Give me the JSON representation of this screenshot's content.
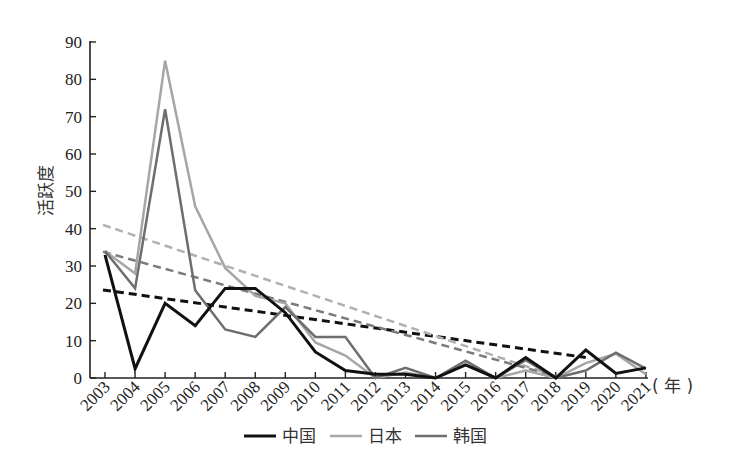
{
  "chart_data": {
    "type": "line",
    "title": "",
    "xlabel": "（年）",
    "ylabel": "活跃度",
    "ylim": [
      0,
      90
    ],
    "yticks": [
      0,
      10,
      20,
      30,
      40,
      50,
      60,
      70,
      80,
      90
    ],
    "grid": false,
    "legend_position": "bottom",
    "categories": [
      "2003",
      "2004",
      "2005",
      "2006",
      "2007",
      "2008",
      "2009",
      "2010",
      "2011",
      "2012",
      "2013",
      "2014",
      "2015",
      "2016",
      "2017",
      "2018",
      "2019",
      "2020",
      "2021"
    ],
    "series": [
      {
        "name": "中国",
        "color": "#111111",
        "width": 3,
        "values": [
          33,
          2.5,
          20,
          14,
          24,
          24,
          17.5,
          7,
          2,
          1,
          1,
          0,
          3.5,
          0,
          5.5,
          0,
          7.5,
          1.2,
          2.7
        ]
      },
      {
        "name": "日本",
        "color": "#a6a6a6",
        "width": 2.5,
        "values": [
          34,
          28,
          85,
          46,
          29.5,
          22,
          20,
          9.5,
          6,
          0,
          1.5,
          0,
          3.5,
          0,
          2,
          0,
          4,
          6.5,
          1
        ]
      },
      {
        "name": "韩国",
        "color": "#6e6e6e",
        "width": 2.5,
        "values": [
          34,
          24,
          72,
          23.5,
          13,
          11,
          19,
          11,
          11,
          0,
          2.7,
          0,
          4.6,
          0,
          4.8,
          0,
          2,
          6.8,
          2.5
        ]
      }
    ],
    "trendlines": [
      {
        "series": "中国",
        "color": "#111111",
        "dash": "8,5",
        "width": 3,
        "from": {
          "x": "2003",
          "y": 23.6
        },
        "to": {
          "x": "2019",
          "y": 5.5
        }
      },
      {
        "series": "日本",
        "color": "#b0b0b0",
        "dash": "8,5",
        "width": 2.5,
        "from": {
          "x": "2003",
          "y": 41
        },
        "to": {
          "x": "2018",
          "y": 0.5
        }
      },
      {
        "series": "韩国",
        "color": "#7a7a7a",
        "dash": "8,5",
        "width": 2.5,
        "from": {
          "x": "2003",
          "y": 33.8
        },
        "to": {
          "x": "2018",
          "y": 0.5
        }
      }
    ]
  },
  "legend": {
    "items": [
      {
        "label": "中国",
        "color": "#111111"
      },
      {
        "label": "日本",
        "color": "#a6a6a6"
      },
      {
        "label": "韩国",
        "color": "#6e6e6e"
      }
    ]
  },
  "axis": {
    "ylabel": "活跃度",
    "xunit": "( 年 )"
  }
}
